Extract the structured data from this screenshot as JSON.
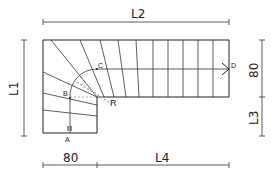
{
  "drawing": {
    "title": "L-shaped quarter-turn winder staircase plan",
    "dimensions": {
      "top": "L2",
      "left": "L1",
      "right_upper": "80",
      "right_lower": "L3",
      "bottom_left": "80",
      "bottom_right": "L4"
    },
    "points": {
      "a": "A",
      "b": "B",
      "c": "C",
      "d": "D",
      "r": "R"
    },
    "marker": "II",
    "colors": {
      "line": "#222222",
      "background": "#ffffff",
      "hatch": "#bbbbbb"
    }
  }
}
